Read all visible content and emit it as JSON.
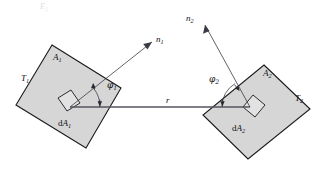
{
  "figure": {
    "background_color": "#ffffff",
    "surface_fill_color": "#d6d6d6",
    "outline_color": "#1a1a1a",
    "ray_color": "#3a3a44"
  },
  "surfaces": {
    "left": {
      "area_label": "A",
      "area_sub": "1",
      "temperature_label": "T",
      "temperature_sub": "1",
      "element_label": "d",
      "element_label_italic": "A",
      "element_sub": "2s",
      "element_text": "dA",
      "element_text_sub": "1"
    },
    "right": {
      "area_label": "A",
      "area_sub": "2",
      "temperature_label": "T",
      "temperature_sub": "2",
      "element_text": "dA",
      "element_text_sub": "2"
    }
  },
  "normals": {
    "left": {
      "label": "n",
      "sub": "1"
    },
    "right": {
      "label": "n",
      "sub": "2"
    }
  },
  "angles": {
    "left": {
      "symbol": "φ",
      "sub": "1"
    },
    "right": {
      "symbol": "φ",
      "sub": "2"
    }
  },
  "distance": {
    "label": "r"
  },
  "ghost": {
    "top_fragment": "E₁"
  }
}
